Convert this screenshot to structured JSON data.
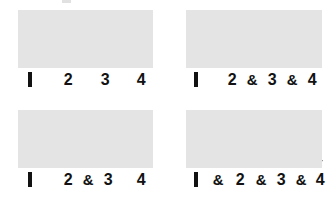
{
  "figure": {
    "colors": {
      "staff_fill": "#e4e4e4",
      "ink": "#121212",
      "background": "#ffffff"
    },
    "arrow_legend": {
      "down": "downstroke",
      "up": "upstroke"
    },
    "panels": [
      {
        "id": "panel-top-left",
        "name": "quarter-notes",
        "box": {
          "x": 18,
          "y": 10,
          "w": 135,
          "h": 58
        },
        "label_y": 70,
        "labels": [
          {
            "text": "1",
            "x": 30,
            "style": "one-bar"
          },
          {
            "text": "2",
            "x": 68,
            "style": "numeral"
          },
          {
            "text": "3",
            "x": 105,
            "style": "numeral"
          },
          {
            "text": "4",
            "x": 141,
            "style": "numeral"
          }
        ],
        "arrows": [
          {
            "dir": "down",
            "x": 30,
            "top": 22,
            "bottom": 68
          },
          {
            "dir": "down",
            "x": 68,
            "top": 22,
            "bottom": 68
          },
          {
            "dir": "down",
            "x": 105,
            "top": 22,
            "bottom": 68
          },
          {
            "dir": "down",
            "x": 141,
            "top": 22,
            "bottom": 68
          }
        ]
      },
      {
        "id": "panel-top-right",
        "name": "and-of-two-and-of-three",
        "box": {
          "x": 186,
          "y": 10,
          "w": 136,
          "h": 58
        },
        "label_y": 70,
        "labels": [
          {
            "text": "1",
            "x": 196,
            "style": "one-bar"
          },
          {
            "text": "2",
            "x": 232,
            "style": "numeral"
          },
          {
            "text": "&",
            "x": 252,
            "style": "amp"
          },
          {
            "text": "3",
            "x": 272,
            "style": "numeral"
          },
          {
            "text": "&",
            "x": 292,
            "style": "amp"
          },
          {
            "text": "4",
            "x": 312,
            "style": "numeral"
          }
        ],
        "arrows": [
          {
            "dir": "down",
            "x": 196,
            "top": 22,
            "bottom": 68
          },
          {
            "dir": "down",
            "x": 232,
            "top": 22,
            "bottom": 68
          },
          {
            "dir": "up",
            "x": 252,
            "top": 13,
            "bottom": 52
          },
          {
            "dir": "down",
            "x": 272,
            "top": 22,
            "bottom": 68
          },
          {
            "dir": "up",
            "x": 292,
            "top": 13,
            "bottom": 52
          },
          {
            "dir": "down",
            "x": 312,
            "top": 22,
            "bottom": 68
          }
        ]
      },
      {
        "id": "panel-bottom-left",
        "name": "and-of-two",
        "box": {
          "x": 18,
          "y": 110,
          "w": 135,
          "h": 58
        },
        "label_y": 170,
        "labels": [
          {
            "text": "1",
            "x": 30,
            "style": "one-bar"
          },
          {
            "text": "2",
            "x": 68,
            "style": "numeral"
          },
          {
            "text": "&",
            "x": 88,
            "style": "amp"
          },
          {
            "text": "3",
            "x": 108,
            "style": "numeral"
          },
          {
            "text": "4",
            "x": 141,
            "style": "numeral"
          }
        ],
        "arrows": [
          {
            "dir": "down",
            "x": 30,
            "top": 122,
            "bottom": 168
          },
          {
            "dir": "down",
            "x": 68,
            "top": 122,
            "bottom": 168
          },
          {
            "dir": "up",
            "x": 88,
            "top": 113,
            "bottom": 152
          },
          {
            "dir": "down",
            "x": 108,
            "top": 122,
            "bottom": 168
          },
          {
            "dir": "down",
            "x": 141,
            "top": 122,
            "bottom": 168
          }
        ]
      },
      {
        "id": "panel-bottom-right",
        "name": "all-eighths",
        "box": {
          "x": 186,
          "y": 110,
          "w": 136,
          "h": 58
        },
        "label_y": 170,
        "labels": [
          {
            "text": "1",
            "x": 196,
            "style": "one-bar"
          },
          {
            "text": "&",
            "x": 218,
            "style": "amp"
          },
          {
            "text": "2",
            "x": 240,
            "style": "numeral"
          },
          {
            "text": "&",
            "x": 261,
            "style": "amp"
          },
          {
            "text": "3",
            "x": 281,
            "style": "numeral"
          },
          {
            "text": "&",
            "x": 301,
            "style": "amp"
          },
          {
            "text": "4",
            "x": 320,
            "style": "numeral"
          }
        ],
        "arrows": [
          {
            "dir": "down",
            "x": 196,
            "top": 122,
            "bottom": 168
          },
          {
            "dir": "up",
            "x": 218,
            "top": 113,
            "bottom": 152
          },
          {
            "dir": "down",
            "x": 240,
            "top": 122,
            "bottom": 168
          },
          {
            "dir": "up",
            "x": 261,
            "top": 113,
            "bottom": 152
          },
          {
            "dir": "down",
            "x": 281,
            "top": 122,
            "bottom": 168
          },
          {
            "dir": "up",
            "x": 301,
            "top": 113,
            "bottom": 152
          },
          {
            "dir": "down",
            "x": 320,
            "top": 122,
            "bottom": 168
          }
        ]
      }
    ]
  }
}
